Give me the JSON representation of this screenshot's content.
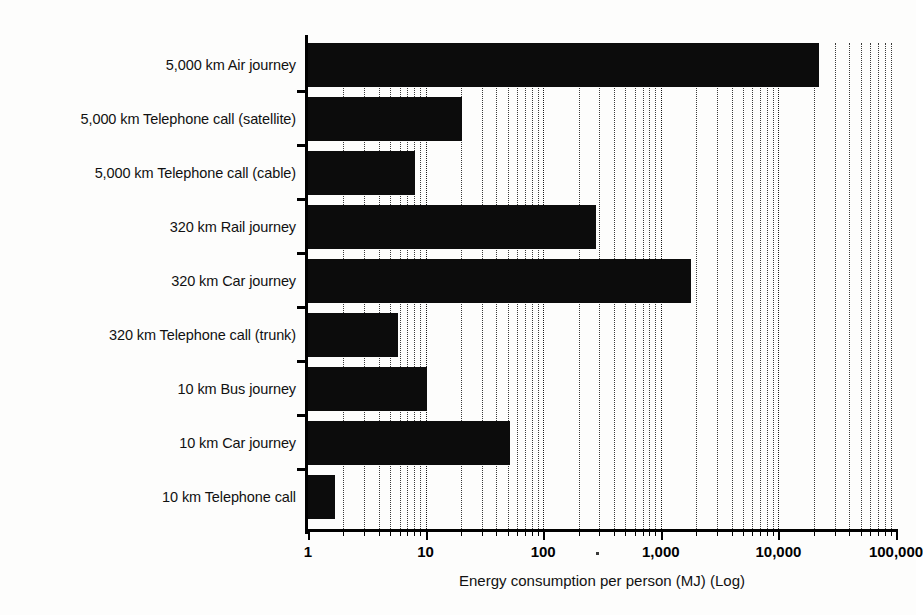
{
  "chart_data": {
    "type": "bar",
    "orientation": "horizontal",
    "title": "",
    "xlabel": "Energy consumption per person (MJ) (Log)",
    "ylabel": "",
    "xscale": "log",
    "xlim": [
      1,
      100000
    ],
    "xticks": [
      1,
      10,
      100,
      1000,
      10000,
      100000
    ],
    "xtick_labels": [
      "1",
      "10",
      "100",
      "1,000",
      "10,000",
      "100,000"
    ],
    "grid": "x-minor-dotted",
    "legend": "none",
    "bar_color": "#0c0c0c",
    "categories": [
      "5,000 km Air journey",
      "5,000 km Telephone call (satellite)",
      "5,000 km Telephone call (cable)",
      "320 km Rail journey",
      "320 km Car journey",
      "320 km Telephone call (trunk)",
      "10 km Bus journey",
      "10 km Car journey",
      "10 km Telephone call"
    ],
    "values": [
      22000,
      20.5,
      8.2,
      280,
      1800,
      5.8,
      10.2,
      52,
      1.7
    ]
  },
  "axis": {
    "title": "Energy consumption per person (MJ) (Log)"
  }
}
